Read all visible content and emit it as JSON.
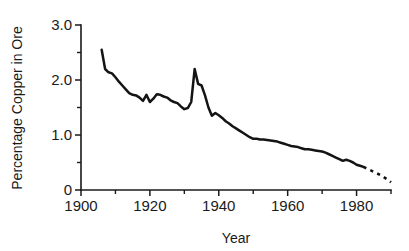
{
  "chart_data": {
    "type": "line",
    "title": "",
    "xlabel": "Year",
    "ylabel": "Percentage Copper in Ore",
    "xlim": [
      1900,
      1990
    ],
    "ylim": [
      0,
      3.0
    ],
    "grid": false,
    "legend": false,
    "x_ticks_major": [
      1900,
      1920,
      1940,
      1960,
      1980
    ],
    "x_ticks_major_labels": [
      "1900",
      "1920",
      "1940",
      "1960",
      "1980"
    ],
    "x_ticks_minor": [
      1910,
      1930,
      1950,
      1970,
      1990
    ],
    "y_ticks_major": [
      0,
      1.0,
      2.0,
      3.0
    ],
    "y_ticks_major_labels": [
      "0",
      "1.0",
      "2.0",
      "3.0"
    ],
    "y_ticks_minor": [
      0.5,
      1.5,
      2.5
    ],
    "series": [
      {
        "name": "Percentage copper in ore (historical)",
        "style": "solid",
        "x": [
          1906,
          1907,
          1908,
          1909,
          1910,
          1911,
          1912,
          1913,
          1914,
          1915,
          1916,
          1917,
          1918,
          1919,
          1920,
          1921,
          1922,
          1923,
          1924,
          1925,
          1926,
          1927,
          1928,
          1929,
          1930,
          1931,
          1932,
          1933,
          1934,
          1935,
          1936,
          1937,
          1938,
          1939,
          1940,
          1941,
          1942,
          1943,
          1944,
          1945,
          1946,
          1947,
          1948,
          1949,
          1950,
          1951,
          1952,
          1953,
          1954,
          1955,
          1956,
          1957,
          1958,
          1959,
          1960,
          1961,
          1962,
          1963,
          1964,
          1965,
          1966,
          1967,
          1968,
          1969,
          1970,
          1971,
          1972,
          1973,
          1974,
          1975,
          1976,
          1977,
          1978,
          1979,
          1980,
          1981,
          1982
        ],
        "y": [
          2.55,
          2.2,
          2.14,
          2.12,
          2.05,
          1.97,
          1.9,
          1.83,
          1.76,
          1.73,
          1.72,
          1.68,
          1.62,
          1.73,
          1.6,
          1.66,
          1.74,
          1.73,
          1.7,
          1.68,
          1.63,
          1.6,
          1.58,
          1.52,
          1.47,
          1.49,
          1.6,
          2.2,
          1.93,
          1.9,
          1.72,
          1.5,
          1.35,
          1.4,
          1.36,
          1.31,
          1.25,
          1.21,
          1.16,
          1.12,
          1.08,
          1.04,
          1.0,
          0.96,
          0.93,
          0.93,
          0.92,
          0.92,
          0.91,
          0.9,
          0.89,
          0.88,
          0.86,
          0.84,
          0.82,
          0.8,
          0.79,
          0.78,
          0.76,
          0.74,
          0.74,
          0.73,
          0.72,
          0.71,
          0.7,
          0.68,
          0.65,
          0.62,
          0.59,
          0.56,
          0.53,
          0.55,
          0.53,
          0.5,
          0.46,
          0.44,
          0.42
        ]
      },
      {
        "name": "Percentage copper in ore (projected)",
        "style": "dashed",
        "x": [
          1982,
          1983,
          1984,
          1985,
          1986,
          1987,
          1988,
          1989,
          1990
        ],
        "y": [
          0.42,
          0.39,
          0.36,
          0.33,
          0.3,
          0.27,
          0.23,
          0.19,
          0.14
        ]
      }
    ]
  },
  "figure": {
    "background_color": "#ffffff",
    "line_color": "#141414",
    "axis_color": "#1a1a1a"
  }
}
